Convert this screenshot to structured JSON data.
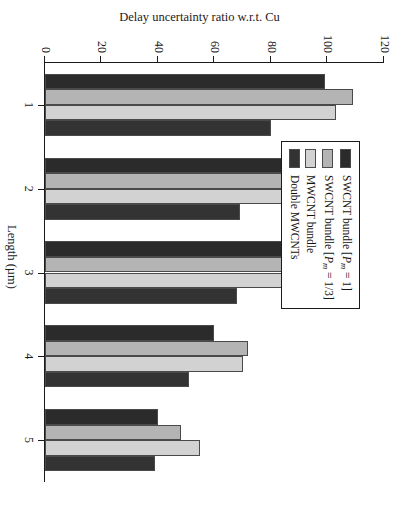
{
  "chart_data": {
    "type": "bar",
    "title": "",
    "xlabel": "Length (µm)",
    "ylabel": "Delay uncertainty ratio w.r.t. Cu",
    "categories": [
      "1",
      "2",
      "3",
      "4",
      "5"
    ],
    "ylim": [
      0,
      120
    ],
    "yticks": [
      0,
      20,
      40,
      60,
      80,
      100,
      120
    ],
    "grid": false,
    "legend_position": "top-left",
    "orientation": "vertical-bars-page-rotated-90",
    "series": [
      {
        "name": "SWCNT bundle [Pm = 1]",
        "name_parts": {
          "prefix": "SWCNT bundle [",
          "italic": "P",
          "sub": "m",
          "suffix": " = 1]"
        },
        "color": "#2b2b2b",
        "values": [
          99,
          98,
          87,
          60,
          40
        ]
      },
      {
        "name": "SWCNT bundle [Pm = 1/3]",
        "name_parts": {
          "prefix": "SWCNT bundle [",
          "italic": "P",
          "sub": "m",
          "suffix": " = 1/3]"
        },
        "color": "#b4b4b4",
        "values": [
          109,
          103,
          96,
          72,
          48
        ]
      },
      {
        "name": "MWCNT bundle",
        "color": "#d2d2d2",
        "values": [
          103,
          96,
          94,
          70,
          55
        ]
      },
      {
        "name": "Double MWCNTs",
        "color": "#333333",
        "values": [
          80,
          69,
          68,
          51,
          39
        ]
      }
    ]
  }
}
